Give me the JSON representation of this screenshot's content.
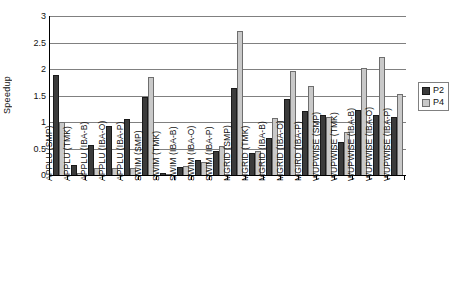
{
  "chart_data": {
    "type": "bar",
    "title": "",
    "xlabel": "",
    "ylabel": "Speedup",
    "ylim": [
      0,
      3
    ],
    "ytick_labels": [
      "3",
      "2.5",
      "2",
      "1.5",
      "1",
      "0.5",
      "0"
    ],
    "ytick_values": [
      3,
      2.5,
      2,
      1.5,
      1,
      0.5,
      0
    ],
    "grid": true,
    "legend_position": "right",
    "categories": [
      "APPLU (SMP)",
      "APPLU (TMK)",
      "APPLU (IBA-B)",
      "APPLU (IBA-O)",
      "APPLU (IBA-P)",
      "SWIM (SMP)",
      "SWIM (TMK)",
      "SWIM (IBA-B)",
      "SWIM (IBA-O)",
      "SWIM (IBA-P)",
      "MGRID (SMP)",
      "MGRID (TMK)",
      "MGRID (IBA-B)",
      "MGRID (IBA-O)",
      "MGIRD (IBA-P)",
      "WUPWISE (SMP)",
      "WUPWISE (TMK)",
      "WUPWISE (IBA-B)",
      "WUPWISE (IBA-O)",
      "WUPWISE (IBA-P)"
    ],
    "series": [
      {
        "name": "P2",
        "color": "#3b3b3b",
        "values": [
          1.88,
          0.18,
          0.57,
          0.93,
          1.06,
          1.48,
          0.03,
          0.16,
          0.29,
          0.46,
          1.65,
          0.42,
          0.7,
          1.43,
          1.2,
          1.14,
          0.62,
          1.22,
          1.13,
          1.1
        ]
      },
      {
        "name": "P4",
        "color": "#c9c9c9",
        "values": [
          1.0,
          0.04,
          0.14,
          0.13,
          0.14,
          1.85,
          0.02,
          0.17,
          0.25,
          0.54,
          2.72,
          0.45,
          1.07,
          1.96,
          1.68,
          1.1,
          0.81,
          2.01,
          2.22,
          1.52
        ]
      }
    ]
  },
  "legend": {
    "entries": [
      {
        "label": "P2"
      },
      {
        "label": "P4"
      }
    ]
  }
}
